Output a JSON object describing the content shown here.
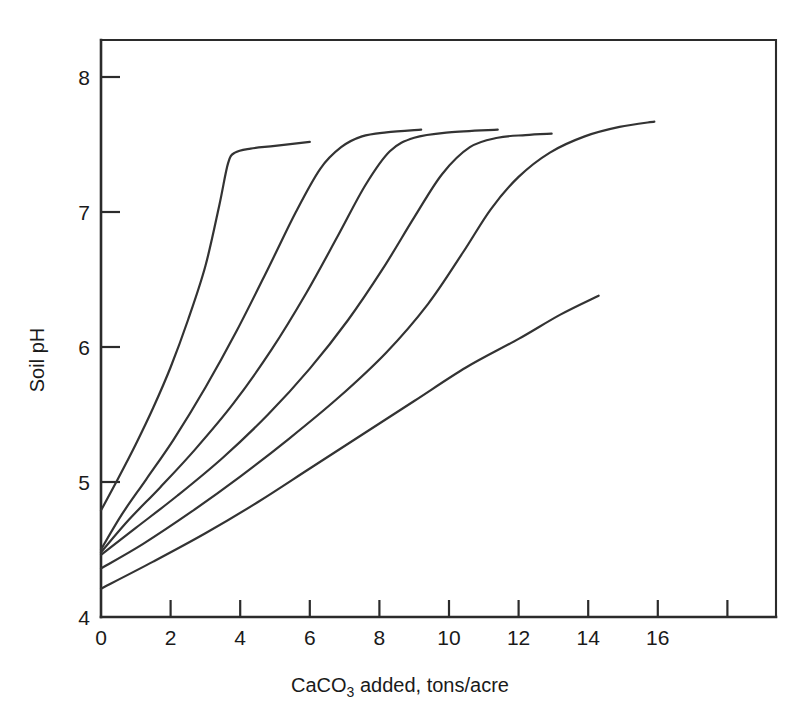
{
  "chart_data": {
    "type": "line",
    "title": "",
    "xlabel": "CaCO3 added, tons/acre",
    "xlabel_parts": {
      "pre": "CaCO",
      "sub": "3",
      "post": " added, tons/acre"
    },
    "ylabel": "Soil pH",
    "xlim": [
      0,
      18
    ],
    "ylim": [
      4,
      8.3
    ],
    "xticks": [
      0,
      2,
      4,
      6,
      8,
      10,
      12,
      14,
      16,
      18
    ],
    "xtick_labels": [
      "0",
      "2",
      "4",
      "6",
      "8",
      "10",
      "12",
      "14",
      "16",
      ""
    ],
    "yticks": [
      4,
      5,
      6,
      7,
      8
    ],
    "ytick_labels": [
      "4",
      "5",
      "6",
      "7",
      "8"
    ],
    "grid": false,
    "legend": "none",
    "line_color": "#333333",
    "axis_color": "#2b2b2b",
    "background": "#ffffff",
    "series": [
      {
        "name": "curve-1",
        "points": [
          [
            0.0,
            4.79
          ],
          [
            0.5,
            5.03
          ],
          [
            1.0,
            5.28
          ],
          [
            1.5,
            5.55
          ],
          [
            2.0,
            5.85
          ],
          [
            2.5,
            6.2
          ],
          [
            3.0,
            6.6
          ],
          [
            3.4,
            7.05
          ],
          [
            3.65,
            7.36
          ],
          [
            3.85,
            7.44
          ],
          [
            4.3,
            7.47
          ],
          [
            5.0,
            7.49
          ],
          [
            6.0,
            7.52
          ]
        ]
      },
      {
        "name": "curve-2",
        "points": [
          [
            0.0,
            4.5
          ],
          [
            0.6,
            4.76
          ],
          [
            1.3,
            5.02
          ],
          [
            2.1,
            5.32
          ],
          [
            3.0,
            5.7
          ],
          [
            3.9,
            6.12
          ],
          [
            4.8,
            6.58
          ],
          [
            5.6,
            7.0
          ],
          [
            6.3,
            7.32
          ],
          [
            6.9,
            7.48
          ],
          [
            7.5,
            7.56
          ],
          [
            8.2,
            7.59
          ],
          [
            9.2,
            7.61
          ]
        ]
      },
      {
        "name": "curve-3",
        "points": [
          [
            0.0,
            4.48
          ],
          [
            0.8,
            4.72
          ],
          [
            1.7,
            4.96
          ],
          [
            2.7,
            5.24
          ],
          [
            3.8,
            5.58
          ],
          [
            4.9,
            5.98
          ],
          [
            5.9,
            6.4
          ],
          [
            6.8,
            6.82
          ],
          [
            7.6,
            7.2
          ],
          [
            8.3,
            7.45
          ],
          [
            9.0,
            7.55
          ],
          [
            10.0,
            7.59
          ],
          [
            11.4,
            7.61
          ]
        ]
      },
      {
        "name": "curve-4",
        "points": [
          [
            0.0,
            4.46
          ],
          [
            1.0,
            4.66
          ],
          [
            2.2,
            4.9
          ],
          [
            3.5,
            5.18
          ],
          [
            4.8,
            5.5
          ],
          [
            6.0,
            5.84
          ],
          [
            7.1,
            6.2
          ],
          [
            8.1,
            6.58
          ],
          [
            9.0,
            6.96
          ],
          [
            9.8,
            7.28
          ],
          [
            10.6,
            7.48
          ],
          [
            11.4,
            7.55
          ],
          [
            12.2,
            7.57
          ],
          [
            12.95,
            7.58
          ]
        ]
      },
      {
        "name": "curve-5",
        "points": [
          [
            0.0,
            4.36
          ],
          [
            1.2,
            4.54
          ],
          [
            2.6,
            4.78
          ],
          [
            4.0,
            5.04
          ],
          [
            5.4,
            5.32
          ],
          [
            6.8,
            5.62
          ],
          [
            8.2,
            5.96
          ],
          [
            9.4,
            6.32
          ],
          [
            10.4,
            6.7
          ],
          [
            11.2,
            7.02
          ],
          [
            12.0,
            7.26
          ],
          [
            12.9,
            7.44
          ],
          [
            13.9,
            7.56
          ],
          [
            14.9,
            7.63
          ],
          [
            15.9,
            7.67
          ]
        ]
      },
      {
        "name": "curve-6",
        "points": [
          [
            0.0,
            4.21
          ],
          [
            1.5,
            4.41
          ],
          [
            3.0,
            4.62
          ],
          [
            4.5,
            4.85
          ],
          [
            6.0,
            5.1
          ],
          [
            7.5,
            5.35
          ],
          [
            9.0,
            5.6
          ],
          [
            10.5,
            5.85
          ],
          [
            12.0,
            6.06
          ],
          [
            13.2,
            6.24
          ],
          [
            14.3,
            6.38
          ]
        ]
      }
    ]
  },
  "figure": {
    "y_axis_label": "Soil pH",
    "x_axis_label_pre": "CaCO",
    "x_axis_label_sub": "3",
    "x_axis_label_post": " added, tons/acre"
  }
}
